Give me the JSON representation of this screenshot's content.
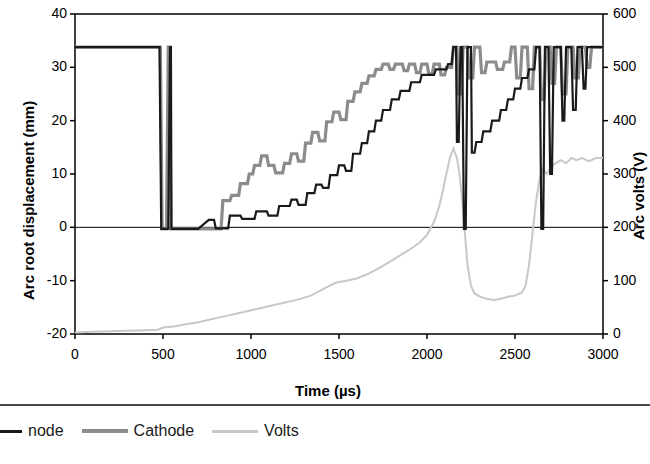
{
  "chart_data": {
    "type": "line",
    "title": "",
    "xlabel": "Time (µs)",
    "ylabel": "Arc root displacement (mm)",
    "y2label": "Arc volts (V)",
    "xlim": [
      0,
      3000
    ],
    "ylim": [
      -20,
      40
    ],
    "y2lim": [
      0,
      600
    ],
    "xticks": [
      0,
      500,
      1000,
      1500,
      2000,
      2500,
      3000
    ],
    "yticks": [
      -20,
      -10,
      0,
      10,
      20,
      30,
      40
    ],
    "y2ticks": [
      0,
      100,
      200,
      300,
      400,
      500,
      600
    ],
    "grid": false,
    "legend_position": "bottom",
    "series": [
      {
        "name": "Anode",
        "color": "#1a1a1a",
        "axis": "left",
        "points": [
          [
            0,
            33.8
          ],
          [
            480,
            33.8
          ],
          [
            490,
            -0.3
          ],
          [
            530,
            -0.3
          ],
          [
            540,
            33.8
          ],
          [
            545,
            33.8
          ],
          [
            548,
            -0.3
          ],
          [
            700,
            -0.3
          ],
          [
            760,
            1.4
          ],
          [
            790,
            1.4
          ],
          [
            800,
            -0.2
          ],
          [
            870,
            -0.2
          ],
          [
            880,
            2.2
          ],
          [
            940,
            2.2
          ],
          [
            950,
            1.6
          ],
          [
            1020,
            1.6
          ],
          [
            1030,
            3.0
          ],
          [
            1090,
            3.0
          ],
          [
            1100,
            2.2
          ],
          [
            1150,
            2.2
          ],
          [
            1160,
            4.0
          ],
          [
            1220,
            4.0
          ],
          [
            1230,
            5.2
          ],
          [
            1260,
            5.2
          ],
          [
            1270,
            4.2
          ],
          [
            1310,
            4.2
          ],
          [
            1320,
            6.4
          ],
          [
            1360,
            6.4
          ],
          [
            1370,
            8.0
          ],
          [
            1400,
            8.0
          ],
          [
            1410,
            7.4
          ],
          [
            1440,
            7.4
          ],
          [
            1450,
            9.8
          ],
          [
            1490,
            9.8
          ],
          [
            1500,
            11.6
          ],
          [
            1530,
            11.6
          ],
          [
            1540,
            10.6
          ],
          [
            1570,
            10.6
          ],
          [
            1580,
            13.8
          ],
          [
            1620,
            13.8
          ],
          [
            1630,
            15.8
          ],
          [
            1660,
            15.8
          ],
          [
            1670,
            18.0
          ],
          [
            1700,
            18.0
          ],
          [
            1710,
            20.0
          ],
          [
            1740,
            20.0
          ],
          [
            1750,
            22.0
          ],
          [
            1790,
            22.0
          ],
          [
            1800,
            24.0
          ],
          [
            1840,
            24.0
          ],
          [
            1850,
            25.6
          ],
          [
            1900,
            25.6
          ],
          [
            1910,
            27.2
          ],
          [
            1960,
            27.2
          ],
          [
            1970,
            28.6
          ],
          [
            2040,
            28.6
          ],
          [
            2050,
            29.6
          ],
          [
            2110,
            29.6
          ],
          [
            2120,
            30.6
          ],
          [
            2140,
            30.6
          ],
          [
            2150,
            33.8
          ],
          [
            2165,
            33.8
          ],
          [
            2170,
            16.0
          ],
          [
            2180,
            16.0
          ],
          [
            2190,
            33.8
          ],
          [
            2200,
            33.8
          ],
          [
            2210,
            -0.3
          ],
          [
            2220,
            -0.3
          ],
          [
            2230,
            33.8
          ],
          [
            2250,
            33.8
          ],
          [
            2255,
            14.0
          ],
          [
            2270,
            14.0
          ],
          [
            2280,
            16.0
          ],
          [
            2310,
            16.0
          ],
          [
            2320,
            18.0
          ],
          [
            2360,
            18.0
          ],
          [
            2370,
            20.0
          ],
          [
            2410,
            20.0
          ],
          [
            2420,
            22.0
          ],
          [
            2450,
            22.0
          ],
          [
            2460,
            24.0
          ],
          [
            2490,
            24.0
          ],
          [
            2500,
            26.0
          ],
          [
            2530,
            26.0
          ],
          [
            2540,
            28.0
          ],
          [
            2570,
            28.0
          ],
          [
            2580,
            29.6
          ],
          [
            2610,
            29.6
          ],
          [
            2620,
            33.8
          ],
          [
            2640,
            33.8
          ],
          [
            2650,
            -0.3
          ],
          [
            2660,
            -0.3
          ],
          [
            2670,
            33.8
          ],
          [
            2690,
            33.8
          ],
          [
            2700,
            10.0
          ],
          [
            2710,
            10.0
          ],
          [
            2720,
            33.8
          ],
          [
            2760,
            33.8
          ],
          [
            2770,
            20.0
          ],
          [
            2780,
            20.0
          ],
          [
            2790,
            33.8
          ],
          [
            2820,
            33.8
          ],
          [
            2830,
            22.0
          ],
          [
            2845,
            22.0
          ],
          [
            2855,
            33.8
          ],
          [
            2880,
            33.8
          ],
          [
            2890,
            26.0
          ],
          [
            2900,
            26.0
          ],
          [
            2910,
            33.8
          ],
          [
            3000,
            33.8
          ]
        ]
      },
      {
        "name": "Cathode",
        "color": "#8c8c8c",
        "axis": "left",
        "points": [
          [
            0,
            33.8
          ],
          [
            485,
            33.8
          ],
          [
            495,
            -0.3
          ],
          [
            520,
            -0.3
          ],
          [
            530,
            33.8
          ],
          [
            538,
            33.8
          ],
          [
            545,
            -0.3
          ],
          [
            830,
            -0.3
          ],
          [
            840,
            5.0
          ],
          [
            880,
            5.0
          ],
          [
            890,
            6.0
          ],
          [
            930,
            6.0
          ],
          [
            940,
            8.2
          ],
          [
            980,
            8.2
          ],
          [
            990,
            10.0
          ],
          [
            1010,
            10.0
          ],
          [
            1020,
            11.6
          ],
          [
            1050,
            11.6
          ],
          [
            1060,
            13.4
          ],
          [
            1090,
            13.4
          ],
          [
            1100,
            11.6
          ],
          [
            1130,
            11.6
          ],
          [
            1140,
            10.2
          ],
          [
            1180,
            10.2
          ],
          [
            1190,
            12.0
          ],
          [
            1220,
            12.0
          ],
          [
            1230,
            13.8
          ],
          [
            1260,
            13.8
          ],
          [
            1270,
            12.4
          ],
          [
            1300,
            12.4
          ],
          [
            1310,
            15.8
          ],
          [
            1340,
            15.8
          ],
          [
            1350,
            17.8
          ],
          [
            1380,
            17.8
          ],
          [
            1390,
            16.2
          ],
          [
            1420,
            16.2
          ],
          [
            1430,
            19.8
          ],
          [
            1460,
            19.8
          ],
          [
            1470,
            21.6
          ],
          [
            1500,
            21.6
          ],
          [
            1510,
            20.2
          ],
          [
            1540,
            20.2
          ],
          [
            1550,
            23.6
          ],
          [
            1580,
            23.6
          ],
          [
            1590,
            25.4
          ],
          [
            1620,
            25.4
          ],
          [
            1630,
            27.0
          ],
          [
            1660,
            27.0
          ],
          [
            1670,
            28.4
          ],
          [
            1700,
            28.4
          ],
          [
            1710,
            29.6
          ],
          [
            1740,
            29.6
          ],
          [
            1750,
            30.6
          ],
          [
            1780,
            30.6
          ],
          [
            1790,
            29.6
          ],
          [
            1810,
            29.6
          ],
          [
            1820,
            30.6
          ],
          [
            1860,
            30.6
          ],
          [
            1870,
            29.4
          ],
          [
            1890,
            29.4
          ],
          [
            1900,
            30.6
          ],
          [
            1930,
            30.6
          ],
          [
            1940,
            29.0
          ],
          [
            1960,
            29.0
          ],
          [
            1970,
            30.6
          ],
          [
            2000,
            30.6
          ],
          [
            2010,
            28.8
          ],
          [
            2030,
            28.8
          ],
          [
            2040,
            30.6
          ],
          [
            2070,
            30.6
          ],
          [
            2080,
            28.6
          ],
          [
            2100,
            28.6
          ],
          [
            2110,
            30.0
          ],
          [
            2140,
            30.0
          ],
          [
            2150,
            33.8
          ],
          [
            2170,
            33.8
          ],
          [
            2180,
            25.0
          ],
          [
            2195,
            25.0
          ],
          [
            2205,
            33.8
          ],
          [
            2230,
            33.8
          ],
          [
            2240,
            28.0
          ],
          [
            2260,
            28.0
          ],
          [
            2270,
            33.8
          ],
          [
            2300,
            33.8
          ],
          [
            2310,
            29.0
          ],
          [
            2330,
            29.0
          ],
          [
            2340,
            31.0
          ],
          [
            2390,
            31.0
          ],
          [
            2400,
            29.6
          ],
          [
            2430,
            29.6
          ],
          [
            2440,
            31.0
          ],
          [
            2470,
            31.0
          ],
          [
            2480,
            33.8
          ],
          [
            2500,
            33.8
          ],
          [
            2510,
            28.0
          ],
          [
            2530,
            28.0
          ],
          [
            2540,
            33.8
          ],
          [
            2570,
            33.8
          ],
          [
            2580,
            26.0
          ],
          [
            2600,
            26.0
          ],
          [
            2610,
            33.8
          ],
          [
            2640,
            33.8
          ],
          [
            2650,
            24.0
          ],
          [
            2665,
            24.0
          ],
          [
            2675,
            33.8
          ],
          [
            2700,
            33.8
          ],
          [
            2710,
            27.0
          ],
          [
            2725,
            27.0
          ],
          [
            2735,
            33.8
          ],
          [
            2760,
            33.8
          ],
          [
            2770,
            25.0
          ],
          [
            2790,
            25.0
          ],
          [
            2800,
            33.8
          ],
          [
            2830,
            33.8
          ],
          [
            2840,
            28.0
          ],
          [
            2860,
            28.0
          ],
          [
            2870,
            33.8
          ],
          [
            2900,
            33.8
          ],
          [
            2910,
            30.0
          ],
          [
            2925,
            30.0
          ],
          [
            2935,
            33.8
          ],
          [
            3000,
            33.8
          ]
        ]
      },
      {
        "name": "Volts",
        "color": "#c8c8c8",
        "axis": "right",
        "points": [
          [
            0,
            3
          ],
          [
            100,
            4
          ],
          [
            200,
            5
          ],
          [
            300,
            6
          ],
          [
            400,
            7
          ],
          [
            470,
            8
          ],
          [
            500,
            12
          ],
          [
            560,
            14
          ],
          [
            620,
            18
          ],
          [
            700,
            22
          ],
          [
            780,
            28
          ],
          [
            860,
            34
          ],
          [
            940,
            40
          ],
          [
            1020,
            46
          ],
          [
            1100,
            52
          ],
          [
            1180,
            58
          ],
          [
            1260,
            64
          ],
          [
            1340,
            72
          ],
          [
            1420,
            86
          ],
          [
            1480,
            96
          ],
          [
            1540,
            100
          ],
          [
            1600,
            104
          ],
          [
            1660,
            112
          ],
          [
            1720,
            122
          ],
          [
            1780,
            134
          ],
          [
            1840,
            146
          ],
          [
            1900,
            158
          ],
          [
            1960,
            172
          ],
          [
            2000,
            186
          ],
          [
            2040,
            210
          ],
          [
            2070,
            240
          ],
          [
            2090,
            268
          ],
          [
            2110,
            300
          ],
          [
            2130,
            330
          ],
          [
            2150,
            348
          ],
          [
            2170,
            330
          ],
          [
            2185,
            300
          ],
          [
            2200,
            250
          ],
          [
            2215,
            190
          ],
          [
            2230,
            130
          ],
          [
            2250,
            90
          ],
          [
            2270,
            76
          ],
          [
            2300,
            70
          ],
          [
            2340,
            66
          ],
          [
            2380,
            64
          ],
          [
            2420,
            66
          ],
          [
            2460,
            70
          ],
          [
            2500,
            72
          ],
          [
            2540,
            78
          ],
          [
            2560,
            90
          ],
          [
            2580,
            130
          ],
          [
            2600,
            190
          ],
          [
            2620,
            250
          ],
          [
            2640,
            290
          ],
          [
            2660,
            310
          ],
          [
            2680,
            300
          ],
          [
            2700,
            310
          ],
          [
            2720,
            318
          ],
          [
            2740,
            322
          ],
          [
            2760,
            326
          ],
          [
            2790,
            320
          ],
          [
            2820,
            330
          ],
          [
            2850,
            326
          ],
          [
            2880,
            330
          ],
          [
            2920,
            324
          ],
          [
            2960,
            330
          ],
          [
            3000,
            330
          ]
        ]
      }
    ]
  },
  "axes": {
    "left_title": "Arc root displacement (mm)",
    "right_title": "Arc volts (V)",
    "x_title": "Time (µs)",
    "left_ticks": [
      "40",
      "30",
      "20",
      "10",
      "0",
      "-10",
      "-20"
    ],
    "right_ticks": [
      "600",
      "500",
      "400",
      "300",
      "200",
      "100",
      "0"
    ],
    "x_ticks": [
      "0",
      "500",
      "1000",
      "1500",
      "2000",
      "2500",
      "3000"
    ]
  },
  "legend": {
    "items": [
      {
        "label": "node",
        "color": "#1a1a1a",
        "width": 3
      },
      {
        "label": "Cathode",
        "color": "#8c8c8c",
        "width": 4
      },
      {
        "label": "Volts",
        "color": "#c8c8c8",
        "width": 3
      }
    ]
  }
}
